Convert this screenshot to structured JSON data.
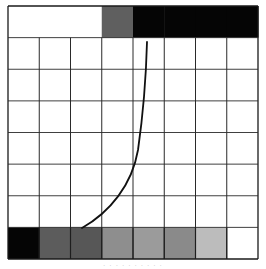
{
  "diagram": {
    "grid": {
      "left": 8,
      "top": 6,
      "right": 258,
      "bottom": 259,
      "columns": 8,
      "rows": 8,
      "line_color": "#2a2a2a",
      "border_color": "#1a1a1a"
    },
    "top_row": {
      "cells": [
        {
          "fill": "#ffffff"
        },
        {
          "fill": "#ffffff"
        },
        {
          "fill": "#ffffff"
        },
        {
          "fill": "#5f5f5f"
        },
        {
          "fill": "#050505"
        },
        {
          "fill": "#050505"
        },
        {
          "fill": "#050505"
        },
        {
          "fill": "#050505"
        }
      ]
    },
    "bottom_row": {
      "cells": [
        {
          "fill": "#050505"
        },
        {
          "fill": "#5c5c5c"
        },
        {
          "fill": "#575757"
        },
        {
          "fill": "#8e8e8e"
        },
        {
          "fill": "#9b9b9b"
        },
        {
          "fill": "#8a8a8a"
        },
        {
          "fill": "#bcbcbc"
        },
        {
          "fill": "#ffffff"
        }
      ]
    },
    "curve": {
      "stroke": "#111111",
      "width": 1.8,
      "path": "M 82 228 C 110 212, 132 185, 138 150 C 143 115, 146 80, 147 42"
    },
    "caption": "· · · · · · · · · ·"
  }
}
